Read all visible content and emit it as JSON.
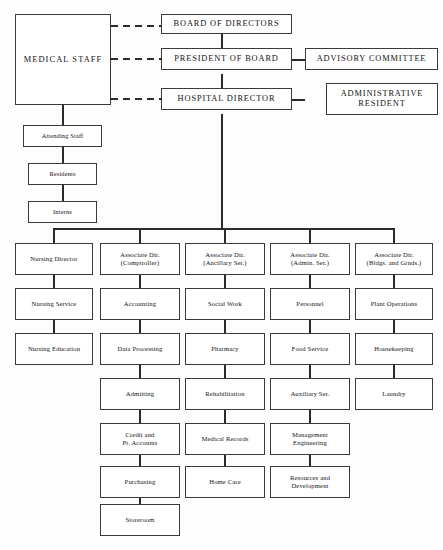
{
  "chart": {
    "line_color": "#2b2b2b",
    "box_border_color": "#3a3a3a",
    "background": "#ffffff"
  },
  "top": {
    "medical_staff": "MEDICAL STAFF",
    "board_of_directors": "BOARD OF DIRECTORS",
    "president_of_board": "PRESIDENT OF BOARD",
    "hospital_director": "HOSPITAL DIRECTOR",
    "advisory_committee": "ADVISORY COMMITTEE",
    "administrative_resident": "ADMINISTRATIVE\nRESIDENT"
  },
  "medical_chain": [
    "Attending Staff",
    "Residents",
    "Interns"
  ],
  "columns": [
    {
      "head": "Nursing Director",
      "items": [
        "Nursing Service",
        "Nursing Education"
      ]
    },
    {
      "head": "Associate Dir.\n(Comptroller)",
      "items": [
        "Accounting",
        "Data Processing",
        "Admitting",
        "Credit and\nPt. Accounts",
        "Purchasing",
        "Storeroom"
      ]
    },
    {
      "head": "Associate Dir.\n(Ancillary Ser.)",
      "items": [
        "Social Work",
        "Pharmacy",
        "Rehabilitation",
        "Medical Records",
        "Home Care"
      ]
    },
    {
      "head": "Associate Dir.\n(Admin. Ser.)",
      "items": [
        "Personnel",
        "Food Service",
        "Auxiliary Ser.",
        "Management\nEngineering",
        "Resources and\nDevelopment"
      ]
    },
    {
      "head": "Associate Dir.\n(Bldgs. and Grnds.)",
      "items": [
        "Plant Operations",
        "Housekeeping",
        "Laundry"
      ]
    }
  ]
}
